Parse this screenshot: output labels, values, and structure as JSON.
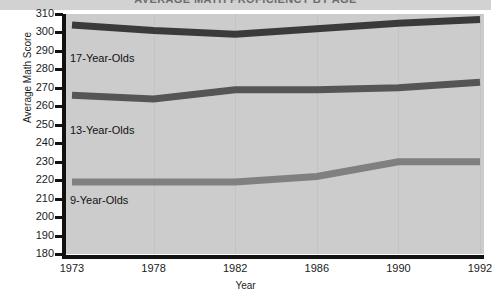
{
  "title": "AVERAGE MATH PROFICIENCY BY AGE",
  "chart_data": {
    "type": "line",
    "title": "AVERAGE MATH PROFICIENCY BY AGE",
    "xlabel": "Year",
    "ylabel": "Average Math Score",
    "categories": [
      "1973",
      "1978",
      "1982",
      "1986",
      "1990",
      "1992"
    ],
    "ylim": [
      180,
      310
    ],
    "yticks": [
      "310",
      "300",
      "290",
      "280",
      "270",
      "260",
      "250",
      "240",
      "230",
      "220",
      "210",
      "200",
      "190",
      "180"
    ],
    "grid": "vertical-faint",
    "legend": "inline-labels",
    "series": [
      {
        "name": "17-Year-Olds",
        "color": "#3a3a3a",
        "values": [
          304,
          301,
          299,
          302,
          305,
          307
        ]
      },
      {
        "name": "13-Year-Olds",
        "color": "#555555",
        "values": [
          266,
          264,
          269,
          269,
          270,
          273
        ]
      },
      {
        "name": "9-Year-Olds",
        "color": "#808080",
        "values": [
          219,
          219,
          219,
          222,
          230,
          230
        ]
      }
    ]
  },
  "series_labels": [
    {
      "text": "17-Year-Olds",
      "left": 70,
      "top": 42
    },
    {
      "text": "13-Year-Olds",
      "left": 70,
      "top": 114
    },
    {
      "text": "9-Year-Olds",
      "left": 70,
      "top": 184
    }
  ],
  "colors": {
    "plot_background": "#cccccc",
    "axis": "#111111",
    "title_strip": "#d2d2d2",
    "page_background": "#ffffff"
  }
}
